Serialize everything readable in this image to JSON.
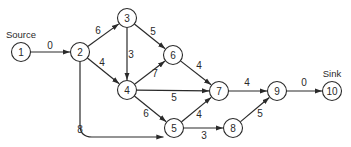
{
  "diagram": {
    "type": "directed-network",
    "labels": {
      "source": "Source",
      "sink": "Sink"
    },
    "nodes": [
      {
        "id": "1",
        "label": "1",
        "x": 21,
        "y": 52
      },
      {
        "id": "2",
        "label": "2",
        "x": 80,
        "y": 52
      },
      {
        "id": "3",
        "label": "3",
        "x": 127,
        "y": 18
      },
      {
        "id": "4",
        "label": "4",
        "x": 127,
        "y": 90
      },
      {
        "id": "5",
        "label": "5",
        "x": 174,
        "y": 128
      },
      {
        "id": "6",
        "label": "6",
        "x": 173,
        "y": 55
      },
      {
        "id": "7",
        "label": "7",
        "x": 219,
        "y": 91
      },
      {
        "id": "8",
        "label": "8",
        "x": 233,
        "y": 128
      },
      {
        "id": "9",
        "label": "9",
        "x": 277,
        "y": 91
      },
      {
        "id": "10",
        "label": "10",
        "x": 332,
        "y": 91
      }
    ],
    "edges": [
      {
        "from": "1",
        "to": "2",
        "weight": "0",
        "lx": 50,
        "ly": 45
      },
      {
        "from": "2",
        "to": "3",
        "weight": "6",
        "lx": 98,
        "ly": 30
      },
      {
        "from": "2",
        "to": "4",
        "weight": "4",
        "lx": 102,
        "ly": 62
      },
      {
        "from": "2",
        "to": "5",
        "weight": "8",
        "lx": 80,
        "ly": 129,
        "curved": true
      },
      {
        "from": "3",
        "to": "4",
        "weight": "3",
        "lx": 131,
        "ly": 54
      },
      {
        "from": "3",
        "to": "6",
        "weight": "5",
        "lx": 153,
        "ly": 31
      },
      {
        "from": "4",
        "to": "6",
        "weight": "7",
        "lx": 155,
        "ly": 73
      },
      {
        "from": "4",
        "to": "7",
        "weight": "5",
        "lx": 174,
        "ly": 97
      },
      {
        "from": "4",
        "to": "5",
        "weight": "6",
        "lx": 146,
        "ly": 113
      },
      {
        "from": "6",
        "to": "7",
        "weight": "4",
        "lx": 199,
        "ly": 65
      },
      {
        "from": "5",
        "to": "7",
        "weight": "4",
        "lx": 199,
        "ly": 114
      },
      {
        "from": "5",
        "to": "8",
        "weight": "3",
        "lx": 204,
        "ly": 135
      },
      {
        "from": "7",
        "to": "9",
        "weight": "4",
        "lx": 247,
        "ly": 82
      },
      {
        "from": "8",
        "to": "9",
        "weight": "5",
        "lx": 260,
        "ly": 113
      },
      {
        "from": "9",
        "to": "10",
        "weight": "0",
        "lx": 304,
        "ly": 82
      }
    ]
  }
}
